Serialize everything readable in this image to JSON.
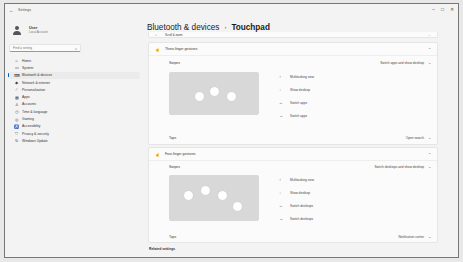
{
  "window": {
    "title": "Settings",
    "controls": [
      "minimize",
      "maximize",
      "close"
    ]
  },
  "sidebar": {
    "user": {
      "name": "User",
      "subtitle": "Local Account"
    },
    "search_placeholder": "Find a setting",
    "items": [
      {
        "label": "Home",
        "icon": "home-icon",
        "glyph": "⌂"
      },
      {
        "label": "System",
        "icon": "system-icon",
        "glyph": "▭"
      },
      {
        "label": "Bluetooth & devices",
        "icon": "bluetooth-devices-icon",
        "glyph": "⌨",
        "active": true
      },
      {
        "label": "Network & internet",
        "icon": "network-icon",
        "glyph": "◆"
      },
      {
        "label": "Personalization",
        "icon": "brush-icon",
        "glyph": "⁄"
      },
      {
        "label": "Apps",
        "icon": "apps-icon",
        "glyph": "▦"
      },
      {
        "label": "Accounts",
        "icon": "accounts-icon",
        "glyph": "♙"
      },
      {
        "label": "Time & language",
        "icon": "time-language-icon",
        "glyph": "◷"
      },
      {
        "label": "Gaming",
        "icon": "gaming-icon",
        "glyph": "◎"
      },
      {
        "label": "Accessibility",
        "icon": "accessibility-icon",
        "glyph": "♿"
      },
      {
        "label": "Privacy & security",
        "icon": "shield-icon",
        "glyph": "⛉"
      },
      {
        "label": "Windows Update",
        "icon": "update-icon",
        "glyph": "↻"
      }
    ]
  },
  "header": {
    "breadcrumb_parent": "Bluetooth & devices",
    "separator": "›",
    "current": "Touchpad"
  },
  "scroll_zoom": {
    "label": "Scroll & zoom"
  },
  "three_finger": {
    "title": "Three-finger gestures",
    "swipes_label": "Swipes",
    "swipes_value": "Switch apps and show desktop",
    "actions": [
      {
        "arrow": "↑",
        "label": "Multitasking view"
      },
      {
        "arrow": "↓",
        "label": "Show desktop"
      },
      {
        "arrow": "←",
        "label": "Switch apps"
      },
      {
        "arrow": "→",
        "label": "Switch apps"
      }
    ],
    "taps_label": "Taps",
    "taps_value": "Open search"
  },
  "four_finger": {
    "title": "Four-finger gestures",
    "swipes_label": "Swipes",
    "swipes_value": "Switch desktops and show desktop",
    "actions": [
      {
        "arrow": "↑",
        "label": "Multitasking view"
      },
      {
        "arrow": "↓",
        "label": "Show desktop"
      },
      {
        "arrow": "←",
        "label": "Switch desktops"
      },
      {
        "arrow": "→",
        "label": "Switch desktops"
      }
    ],
    "taps_label": "Taps",
    "taps_value": "Notification center"
  },
  "related": {
    "label": "Related settings"
  },
  "colors": {
    "accent": "#005fb8",
    "background": "#f3f3f3",
    "card": "#fbfbfb"
  }
}
